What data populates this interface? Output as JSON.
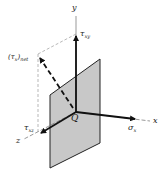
{
  "diagram": {
    "axes": {
      "x": "x",
      "y": "y",
      "z": "z"
    },
    "origin_label": "Q",
    "stresses": {
      "sigma_x": {
        "sym": "σ",
        "sub": "x"
      },
      "tau_xy": {
        "sym": "τ",
        "sub": "xy"
      },
      "tau_xz": {
        "sym": "τ",
        "sub": "xz"
      },
      "tau_net": {
        "open": "(τ",
        "sub1": "x",
        "close": ")",
        "sub2": "net"
      }
    },
    "colors": {
      "plane_fill": "#c8c8c8",
      "line": "#111111",
      "dashed": "#888888"
    }
  }
}
